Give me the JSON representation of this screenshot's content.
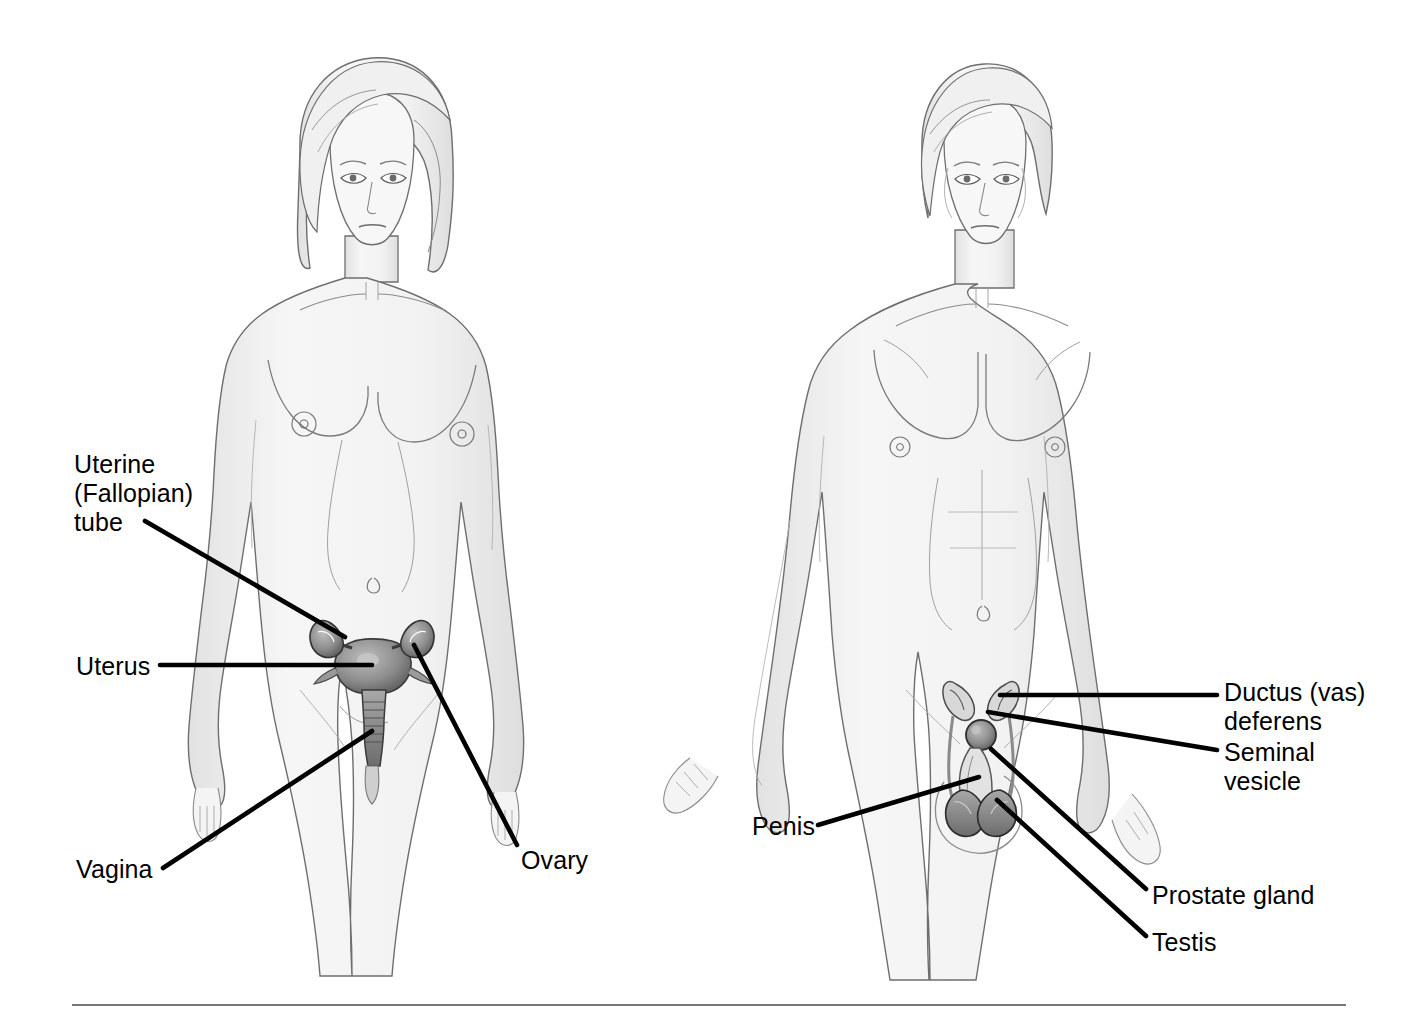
{
  "page": {
    "background_color": "#ffffff",
    "width": 1421,
    "height": 1020
  },
  "style": {
    "label_color": "#000000",
    "leader_color": "#000000",
    "body_fill": "#f2f2f2",
    "body_outline": "#6e6e6e",
    "organ_fill": "#8c8c8c",
    "organ_outline": "#3a3a3a",
    "rule_color": "#777777",
    "label_font_size_px": 25
  },
  "figures": [
    {
      "id": "female-figure",
      "name": "female-body-illustration",
      "sex": "female",
      "center_x": 370,
      "labels": [
        {
          "id": "uterine-tube",
          "lines": [
            "Uterine",
            "(Fallopian)",
            "tube"
          ],
          "text": "Uterine (Fallopian) tube",
          "text_x": 74,
          "text_y": 450,
          "align": "left",
          "leader": {
            "x1": 145,
            "y1": 521,
            "x2": 345,
            "y2": 637
          }
        },
        {
          "id": "uterus",
          "lines": [
            "Uterus"
          ],
          "text": "Uterus",
          "text_x": 76,
          "text_y": 652,
          "align": "left",
          "leader": {
            "x1": 160,
            "y1": 665,
            "x2": 372,
            "y2": 665
          }
        },
        {
          "id": "vagina",
          "lines": [
            "Vagina"
          ],
          "text": "Vagina",
          "text_x": 76,
          "text_y": 855,
          "align": "left",
          "leader": {
            "x1": 163,
            "y1": 868,
            "x2": 372,
            "y2": 731
          }
        },
        {
          "id": "ovary",
          "lines": [
            "Ovary"
          ],
          "text": "Ovary",
          "text_x": 521,
          "text_y": 846,
          "align": "left",
          "leader": {
            "x1": 517,
            "y1": 845,
            "x2": 414,
            "y2": 645
          }
        }
      ]
    },
    {
      "id": "male-figure",
      "name": "male-body-illustration",
      "sex": "male",
      "center_x": 980,
      "labels": [
        {
          "id": "ductus-vas-deferens",
          "lines": [
            "Ductus (vas)",
            "deferens"
          ],
          "text": "Ductus (vas) deferens",
          "text_x": 1224,
          "text_y": 678,
          "align": "left",
          "leader": {
            "x1": 1217,
            "y1": 695,
            "x2": 1000,
            "y2": 695
          }
        },
        {
          "id": "seminal-vesicle",
          "lines": [
            "Seminal",
            "vesicle"
          ],
          "text": "Seminal vesicle",
          "text_x": 1224,
          "text_y": 738,
          "align": "left",
          "leader": {
            "x1": 1217,
            "y1": 750,
            "x2": 988,
            "y2": 712
          }
        },
        {
          "id": "penis",
          "lines": [
            "Penis"
          ],
          "text": "Penis",
          "text_x": 752,
          "text_y": 812,
          "align": "left",
          "leader": {
            "x1": 818,
            "y1": 825,
            "x2": 979,
            "y2": 777
          }
        },
        {
          "id": "prostate-gland",
          "lines": [
            "Prostate gland"
          ],
          "text": "Prostate gland",
          "text_x": 1152,
          "text_y": 881,
          "align": "left",
          "leader": {
            "x1": 1146,
            "y1": 889,
            "x2": 991,
            "y2": 749
          }
        },
        {
          "id": "testis",
          "lines": [
            "Testis"
          ],
          "text": "Testis",
          "text_x": 1152,
          "text_y": 928,
          "align": "left",
          "leader": {
            "x1": 1146,
            "y1": 936,
            "x2": 997,
            "y2": 800
          }
        }
      ]
    }
  ],
  "footer_rule": {
    "name": "bottom-divider",
    "x1": 72,
    "x2": 1346,
    "y": 1005
  }
}
